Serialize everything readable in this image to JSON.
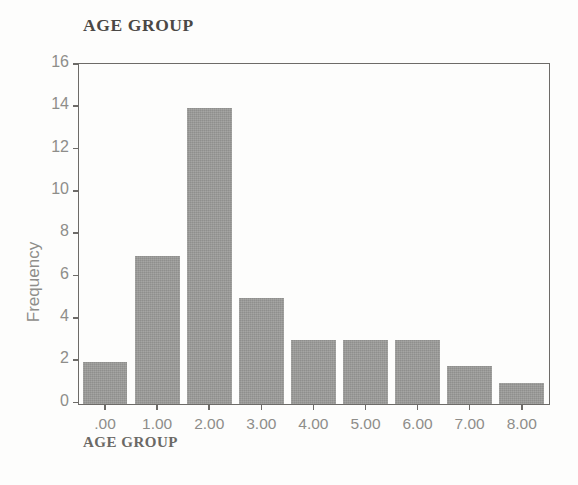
{
  "chart_data": {
    "type": "bar",
    "title": "AGE GROUP",
    "xlabel": "AGE GROUP",
    "ylabel": "Frequency",
    "categories": [
      ".00",
      "1.00",
      "2.00",
      "3.00",
      "4.00",
      "5.00",
      "6.00",
      "7.00",
      "8.00"
    ],
    "values": [
      2,
      7,
      14,
      5,
      3,
      3,
      3,
      1.8,
      1
    ],
    "ylim": [
      0,
      16
    ],
    "yticks": [
      0,
      2,
      4,
      6,
      8,
      10,
      12,
      14,
      16
    ],
    "ytick_labels": [
      "0",
      "2",
      "4",
      "6",
      "8",
      "10",
      "12",
      "14",
      "16"
    ],
    "grid": false,
    "legend": "none",
    "bar_color": "#9b9b99",
    "axis_color": "#6d6b68",
    "tick_label_color": "#8e8d8a",
    "title_color": "#4a4845"
  }
}
